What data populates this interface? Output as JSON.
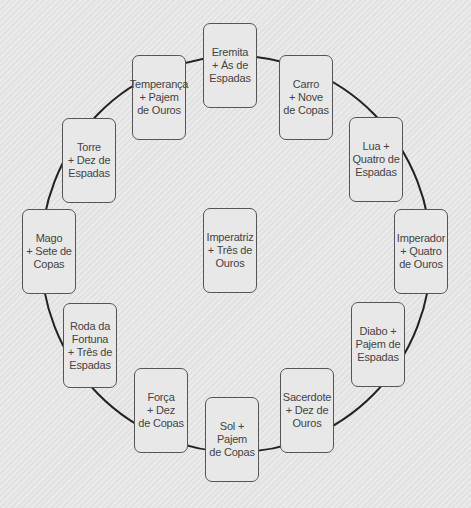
{
  "diagram": {
    "ring_color": "#222222",
    "center": {
      "label": "Imperatriz\n+ Três de\nOuros",
      "pos": {
        "x": 203,
        "y": 208
      }
    },
    "cards": [
      {
        "id": "eremita",
        "label": "Eremita\n+ Ás de\nEspadas",
        "x": 203,
        "y": 23
      },
      {
        "id": "carro",
        "label": "Carro\n+ Nove\nde Copas",
        "x": 279,
        "y": 55
      },
      {
        "id": "lua",
        "label": "Lua +\nQuatro de\nEspadas",
        "x": 349,
        "y": 117
      },
      {
        "id": "imperador",
        "label": "Imperador\n+ Quatro\nde Ouros",
        "x": 394,
        "y": 209
      },
      {
        "id": "diabo",
        "label": "Diabo +\nPajem de\nEspadas",
        "x": 351,
        "y": 302
      },
      {
        "id": "sacerdote",
        "label": "Sacerdote\n+ Dez de\nOuros",
        "x": 280,
        "y": 368
      },
      {
        "id": "sol",
        "label": "Sol +\nPajem\nde Copas",
        "x": 205,
        "y": 397
      },
      {
        "id": "forca",
        "label": "Força\n+ Dez\nde Copas",
        "x": 134,
        "y": 368
      },
      {
        "id": "roda-da-fortuna",
        "label": "Roda da\nFortuna\n+ Três de\nEspadas",
        "x": 63,
        "y": 303
      },
      {
        "id": "mago",
        "label": "Mago\n+ Sete de\nCopas",
        "x": 22,
        "y": 209
      },
      {
        "id": "torre",
        "label": "Torre\n+ Dez de\nEspadas",
        "x": 62,
        "y": 118
      },
      {
        "id": "temperanca",
        "label": "Temperança\n+ Pajem\nde Ouros",
        "x": 132,
        "y": 55
      }
    ]
  }
}
